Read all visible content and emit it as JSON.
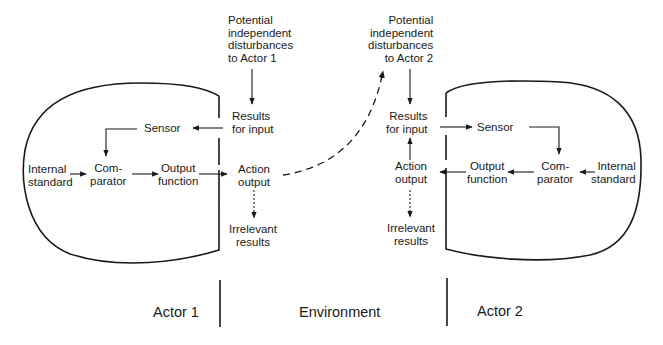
{
  "actor1": {
    "internal_standard": [
      "Internal",
      "standard"
    ],
    "comparator": [
      "Com-",
      "parator"
    ],
    "output_function": [
      "Output",
      "function"
    ],
    "sensor": "Sensor",
    "label": "Actor 1"
  },
  "actor2": {
    "internal_standard": [
      "Internal",
      "standard"
    ],
    "comparator": [
      "Com-",
      "parator"
    ],
    "output_function": [
      "Output",
      "function"
    ],
    "sensor": "Sensor",
    "label": "Actor 2"
  },
  "environment": {
    "label": "Environment",
    "disturbances_actor1": [
      "Potential",
      "independent",
      "disturbances",
      "to Actor 1"
    ],
    "disturbances_actor2": [
      "Potential",
      "independent",
      "disturbances",
      "to Actor 2"
    ],
    "results_for_input_1": [
      "Results",
      "for input"
    ],
    "results_for_input_2": [
      "Results",
      "for input"
    ],
    "action_output_1": [
      "Action",
      "output"
    ],
    "action_output_2": [
      "Action",
      "output"
    ],
    "irrelevant_results_1": [
      "Irrelevant",
      "results"
    ],
    "irrelevant_results_2": [
      "Irrelevant",
      "results"
    ]
  },
  "colors": {
    "stroke": "#1a1a1a",
    "background": "#ffffff"
  }
}
